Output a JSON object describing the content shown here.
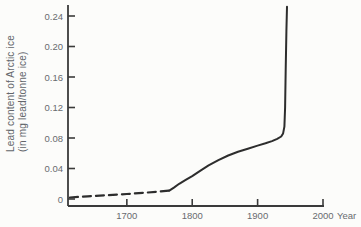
{
  "figure": {
    "background": "#fcfcfa",
    "axis_color": "#3a3a3a",
    "curve_color": "#2d2d2d",
    "label_color": "#696b6f"
  },
  "chart_data": {
    "type": "line",
    "ylabel_line1": "Lead content of Arctic ice",
    "ylabel_line2": "(in mg lead/tonne ice)",
    "xlabel": "Year",
    "xlim": [
      1610,
      2000
    ],
    "ylim": [
      0,
      0.26
    ],
    "grid": false,
    "legend": "none",
    "x_ticks": [
      {
        "v": 1700,
        "label": "1700"
      },
      {
        "v": 1800,
        "label": "1800"
      },
      {
        "v": 1900,
        "label": "1900"
      },
      {
        "v": 2000,
        "label": "2000"
      }
    ],
    "y_ticks": [
      {
        "v": 0,
        "label": "0"
      },
      {
        "v": 0.04,
        "label": "0.04"
      },
      {
        "v": 0.08,
        "label": "0.08"
      },
      {
        "v": 0.12,
        "label": "0.12"
      },
      {
        "v": 0.16,
        "label": "0.16"
      },
      {
        "v": 0.2,
        "label": "0.20"
      },
      {
        "v": 0.24,
        "label": "0.24"
      }
    ],
    "series": [
      {
        "name": "estimated-historic-lead",
        "style": "dashed",
        "points": [
          [
            1613,
            0.002
          ],
          [
            1640,
            0.0035
          ],
          [
            1670,
            0.005
          ],
          [
            1700,
            0.0065
          ],
          [
            1725,
            0.008
          ],
          [
            1745,
            0.0095
          ],
          [
            1765,
            0.011
          ]
        ]
      },
      {
        "name": "measured-lead",
        "style": "solid",
        "points": [
          [
            1765,
            0.011
          ],
          [
            1772,
            0.015
          ],
          [
            1780,
            0.02
          ],
          [
            1790,
            0.025
          ],
          [
            1800,
            0.03
          ],
          [
            1812,
            0.037
          ],
          [
            1825,
            0.044
          ],
          [
            1840,
            0.051
          ],
          [
            1855,
            0.057
          ],
          [
            1870,
            0.062
          ],
          [
            1885,
            0.066
          ],
          [
            1900,
            0.07
          ],
          [
            1912,
            0.073
          ],
          [
            1922,
            0.076
          ],
          [
            1930,
            0.079
          ],
          [
            1936,
            0.082
          ],
          [
            1939,
            0.086
          ],
          [
            1941,
            0.095
          ],
          [
            1942,
            0.12
          ],
          [
            1943,
            0.17
          ],
          [
            1944,
            0.22
          ],
          [
            1945,
            0.252
          ]
        ]
      }
    ]
  }
}
